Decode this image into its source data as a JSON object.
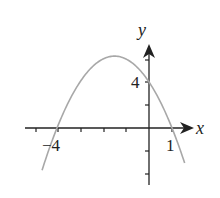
{
  "chart_data": {
    "type": "line",
    "title": "",
    "xlabel": "x",
    "ylabel": "y",
    "function": "y = -(x+4)(x-1) = -x^2 - 3x + 4",
    "x_intercepts": [
      -4,
      1
    ],
    "y_intercept": 4,
    "vertex": [
      -1.5,
      6.25
    ],
    "tick_labels": {
      "x": [
        "-4",
        "1"
      ],
      "y": [
        "4"
      ]
    },
    "x_ticks": [
      -5,
      -4,
      -3,
      -2,
      -1,
      1
    ],
    "y_ticks": [
      -4,
      -2,
      2,
      4,
      6
    ],
    "xlim": [
      -5.5,
      2
    ],
    "ylim": [
      -5,
      7
    ],
    "grid": false,
    "curve_color": "#a8a8a8",
    "axis_color": "#222222"
  },
  "labels": {
    "x_axis": "x",
    "y_axis": "y",
    "x_neg4": "−4",
    "x_1": "1",
    "y_4": "4"
  }
}
